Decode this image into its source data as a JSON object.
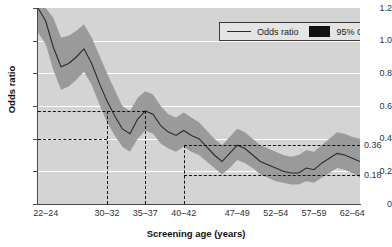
{
  "chart_data": {
    "type": "line",
    "title": "",
    "xlabel": "Screening age (years)",
    "ylabel": "Odds ratio",
    "grid": true,
    "legend_position": "top-right",
    "ylim": [
      0,
      1.2
    ],
    "yticks": [
      "0",
      "0.2",
      "0.4",
      "0.6",
      "0.8",
      "1.0",
      "1.2"
    ],
    "ytick_values": [
      0,
      0.2,
      0.4,
      0.6,
      0.8,
      1.0,
      1.2
    ],
    "categories": [
      "22-24",
      "30-32",
      "35-37",
      "40-42",
      "47-49",
      "52-54",
      "57-59",
      "62-64"
    ],
    "xtick_labels": [
      "22–24",
      "30–32",
      "35–37",
      "40–42",
      "47–49",
      "52–54",
      "57–59",
      "62–64"
    ],
    "legend": [
      {
        "label": "Odds ratio",
        "marker": "line"
      },
      {
        "label": "95% CI",
        "marker": "band"
      }
    ],
    "series": [
      {
        "name": "Odds ratio",
        "x": [
          22,
          23,
          24,
          25,
          26,
          27,
          28,
          29,
          30,
          31,
          32,
          33,
          34,
          35,
          36,
          37,
          38,
          39,
          40,
          41,
          42,
          43,
          44,
          45,
          46,
          47,
          48,
          49,
          50,
          51,
          52,
          53,
          54,
          55,
          56,
          57,
          58,
          59,
          60,
          61,
          62,
          63,
          64
        ],
        "values": [
          1.2,
          1.12,
          0.96,
          0.84,
          0.86,
          0.9,
          0.95,
          0.86,
          0.74,
          0.63,
          0.54,
          0.46,
          0.43,
          0.52,
          0.57,
          0.55,
          0.48,
          0.44,
          0.42,
          0.45,
          0.42,
          0.4,
          0.35,
          0.3,
          0.26,
          0.31,
          0.36,
          0.34,
          0.3,
          0.26,
          0.24,
          0.22,
          0.2,
          0.19,
          0.19,
          0.22,
          0.21,
          0.25,
          0.28,
          0.31,
          0.3,
          0.28,
          0.26
        ]
      }
    ],
    "ci_band": {
      "name": "95% CI",
      "x": [
        22,
        23,
        24,
        25,
        26,
        27,
        28,
        29,
        30,
        31,
        32,
        33,
        34,
        35,
        36,
        37,
        38,
        39,
        40,
        41,
        42,
        43,
        44,
        45,
        46,
        47,
        48,
        49,
        50,
        51,
        52,
        53,
        54,
        55,
        56,
        57,
        58,
        59,
        60,
        61,
        62,
        63,
        64
      ],
      "upper": [
        1.2,
        1.2,
        1.14,
        1.02,
        1.03,
        1.06,
        1.1,
        1.02,
        0.91,
        0.8,
        0.7,
        0.6,
        0.57,
        0.65,
        0.69,
        0.67,
        0.6,
        0.55,
        0.53,
        0.56,
        0.53,
        0.5,
        0.45,
        0.4,
        0.36,
        0.41,
        0.46,
        0.44,
        0.4,
        0.36,
        0.34,
        0.32,
        0.3,
        0.29,
        0.3,
        0.33,
        0.32,
        0.36,
        0.4,
        0.44,
        0.43,
        0.41,
        0.4
      ],
      "lower": [
        1.05,
        0.98,
        0.82,
        0.7,
        0.72,
        0.76,
        0.81,
        0.73,
        0.61,
        0.5,
        0.42,
        0.35,
        0.32,
        0.4,
        0.45,
        0.43,
        0.37,
        0.34,
        0.32,
        0.35,
        0.32,
        0.3,
        0.26,
        0.22,
        0.18,
        0.22,
        0.27,
        0.25,
        0.22,
        0.18,
        0.16,
        0.14,
        0.13,
        0.12,
        0.12,
        0.14,
        0.13,
        0.16,
        0.19,
        0.22,
        0.21,
        0.19,
        0.16
      ]
    },
    "annotations": [
      {
        "name": "upper-reference",
        "y": 0.57,
        "x_end": "35-37",
        "label": ""
      },
      {
        "name": "lower-reference",
        "y": 0.4,
        "x_end": "30-32",
        "label": ""
      },
      {
        "name": "upper-result",
        "y": 0.36,
        "x_start": "40-42",
        "label": "0.36"
      },
      {
        "name": "lower-result",
        "y": 0.18,
        "x_start": "40-42",
        "label": "0.18"
      }
    ],
    "colors": {
      "plot_background": "#d4d4d4",
      "gridline": "#ffffff",
      "ci_band": "#9a9a9a",
      "line": "#2b2b2b",
      "annotation": "#111111",
      "axis": "#4a4a4a"
    }
  }
}
